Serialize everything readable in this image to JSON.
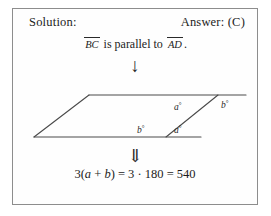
{
  "header": {
    "solution_label": "Solution:",
    "answer_label": "Answer: (C)"
  },
  "statement": {
    "segment_1": "BC",
    "middle_text": " is parallel to ",
    "segment_2": "AD",
    "period": "."
  },
  "arrows": {
    "single_down": "↓",
    "double_down": "⇓"
  },
  "figure": {
    "type": "parallelogram-with-transversal",
    "angle_top_left_of_transversal": "a",
    "angle_top_right_of_transversal": "b",
    "angle_bottom_left_of_transversal": "b",
    "angle_bottom_right_of_transversal": "a",
    "degree_symbol": "°",
    "line_color": "#4a4a4a"
  },
  "equation": {
    "coefficient": "3(",
    "var_a": "a",
    "plus": " + ",
    "var_b": "b",
    "close": ") = 3",
    "dot": " · ",
    "value_180": "180",
    "equals": " = ",
    "value_540": "540"
  }
}
